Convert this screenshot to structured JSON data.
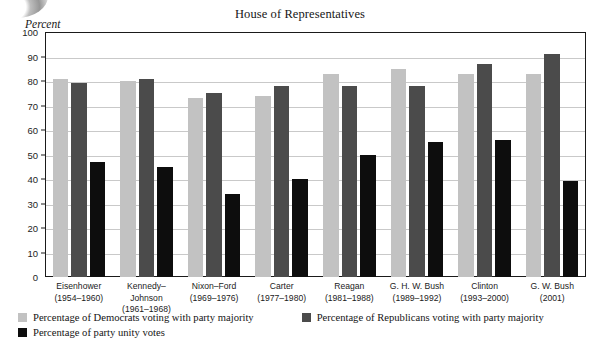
{
  "chart_data": {
    "type": "bar",
    "title": "House of Representatives",
    "ylabel": "Percent",
    "xlabel": "",
    "ylim": [
      0,
      100
    ],
    "ytick_step": 10,
    "yticks": [
      0,
      10,
      20,
      30,
      40,
      50,
      60,
      70,
      80,
      90,
      100
    ],
    "grid": true,
    "legend_position": "below",
    "categories": [
      {
        "name": "Eisenhower",
        "years": "(1954–1960)"
      },
      {
        "name": "Kennedy–Johnson",
        "years": "(1961–1968)"
      },
      {
        "name": "Nixon–Ford",
        "years": "(1969–1976)"
      },
      {
        "name": "Carter",
        "years": "(1977–1980)"
      },
      {
        "name": "Reagan",
        "years": "(1981–1988)"
      },
      {
        "name": "G. H. W. Bush",
        "years": "(1989–1992)"
      },
      {
        "name": "Clinton",
        "years": "(1993–2000)"
      },
      {
        "name": "G. W. Bush",
        "years": "(2001)"
      }
    ],
    "series": [
      {
        "name": "Percentage of Democrats voting with party majority",
        "key": "dem",
        "color": "#c2c2c2",
        "values": [
          81,
          80,
          73,
          74,
          83,
          85,
          83,
          83
        ]
      },
      {
        "name": "Percentage of Republicans voting with party majority",
        "key": "rep",
        "color": "#4b4b4b",
        "values": [
          79,
          81,
          75,
          78,
          78,
          78,
          87,
          91
        ]
      },
      {
        "name": "Percentage of party unity votes",
        "key": "unity",
        "color": "#0d0d0d",
        "values": [
          47,
          45,
          34,
          40,
          50,
          55,
          56,
          39
        ]
      }
    ]
  },
  "legend": {
    "dem_label": "Percentage of Democrats voting with party majority",
    "rep_label": "Percentage of Republicans voting with party majority",
    "unity_label": "Percentage of party unity votes"
  }
}
